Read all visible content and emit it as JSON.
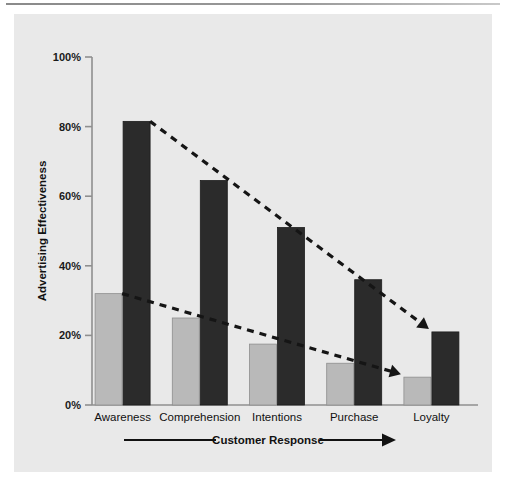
{
  "chart_data": {
    "type": "bar",
    "title": "",
    "xlabel": "Customer Response",
    "ylabel": "Advertising Effectiveness",
    "categories": [
      "Awareness",
      "Comprehension",
      "Intentions",
      "Purchase",
      "Loyalty"
    ],
    "series": [
      {
        "name": "light-gray-series",
        "color": "#b9b9b9",
        "values": [
          32,
          25,
          17.5,
          12,
          8
        ]
      },
      {
        "name": "dark-series",
        "color": "#2b2b2b",
        "values": [
          81.5,
          64.5,
          51,
          36,
          21
        ]
      }
    ],
    "ylim": [
      0,
      100
    ],
    "ytick_labels": [
      "0%",
      "20%",
      "40%",
      "60%",
      "80%",
      "100%"
    ],
    "ytick_values": [
      0,
      20,
      40,
      60,
      80,
      100
    ],
    "grid": false,
    "legend": "none",
    "annotations": [
      {
        "name": "dark-trend-arrow",
        "style": "dashed-line-with-arrowhead",
        "from": {
          "category": "Awareness",
          "value": 81.5
        },
        "to": {
          "category": "Loyalty",
          "value": 21
        }
      },
      {
        "name": "gray-trend-arrow",
        "style": "dashed-line-with-arrowhead",
        "from": {
          "category": "Awareness",
          "value": 32
        },
        "to": {
          "category": "Loyalty",
          "value": 8
        }
      },
      {
        "name": "customer-response-direction-arrow",
        "style": "horizontal-line-with-arrowhead-right",
        "label": "Customer Response"
      }
    ]
  },
  "colors": {
    "page_background": "#ffffff",
    "panel_background": "#e9e9e9",
    "light_bar": "#b9b9b9",
    "dark_bar": "#2b2b2b",
    "axis": "#6e6e6e",
    "text": "#111111",
    "rule": "#8a8a8a"
  },
  "ticks": {
    "y": [
      {
        "label": "100%"
      },
      {
        "label": "80%"
      },
      {
        "label": "60%"
      },
      {
        "label": "40%"
      },
      {
        "label": "20%"
      },
      {
        "label": "0%"
      }
    ]
  }
}
